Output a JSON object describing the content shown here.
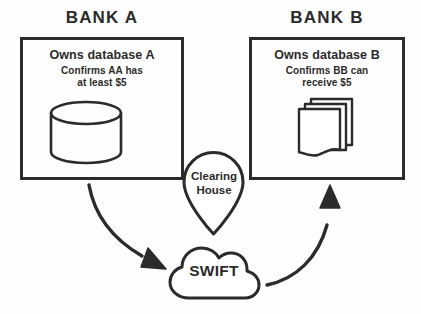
{
  "diagram": {
    "type": "flow-diagram",
    "stroke_color": "#2b2b2b",
    "background_color": "#ffffff",
    "nodes": {
      "bank_a": {
        "title": "BANK A",
        "headline": "Owns database A",
        "detail_lines": [
          "Confirms AA has",
          "at least $5"
        ],
        "detail_text": "Confirms AA has\nat least $5",
        "icon": "database-cylinder-icon"
      },
      "bank_b": {
        "title": "BANK B",
        "headline": "Owns database B",
        "detail_lines": [
          "Confirms BB can",
          "receive $5"
        ],
        "detail_text": "Confirms BB can\nreceive $5",
        "icon": "documents-stack-icon"
      },
      "clearing_house": {
        "label_lines": [
          "Clearing",
          "House"
        ],
        "label_text": "Clearing\nHouse",
        "shape": "map-pin"
      },
      "swift": {
        "label": "SWIFT",
        "shape": "cloud"
      }
    },
    "edges": [
      {
        "from": "bank_a",
        "to": "swift",
        "style": "curved-arrow",
        "direction": "down-right"
      },
      {
        "from": "swift",
        "to": "bank_b",
        "style": "curved-arrow",
        "direction": "up-right"
      }
    ]
  }
}
